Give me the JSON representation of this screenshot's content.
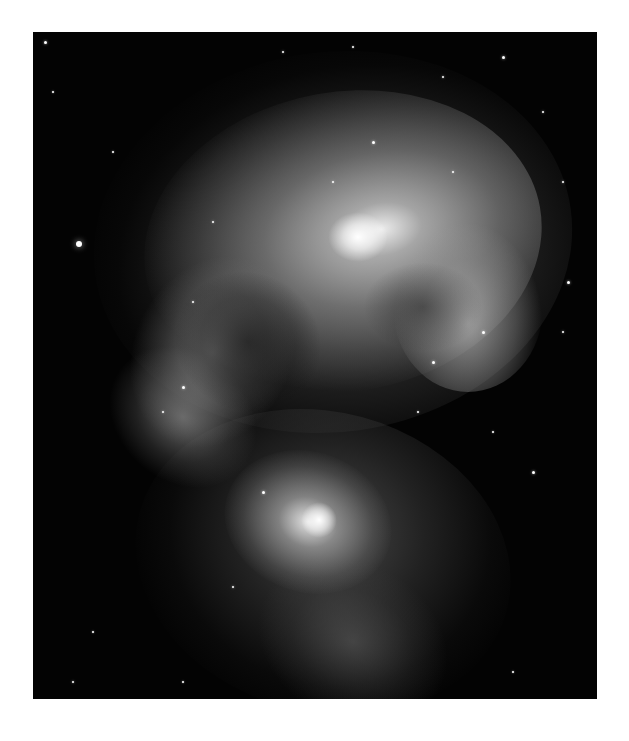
{
  "image": {
    "subject": "Interacting spiral galaxies in grayscale",
    "style": "grayscale astronomical photograph",
    "border_color": "#ffffff",
    "background_color": "#030303",
    "features": [
      "upper galaxy with bright core and dusty spiral arms",
      "lower galaxy with bright core and faint tidal extension",
      "scattered foreground stars"
    ]
  },
  "stars": [
    {
      "x": 12,
      "y": 10,
      "r": 1.5
    },
    {
      "x": 46,
      "y": 212,
      "r": 3
    },
    {
      "x": 470,
      "y": 25,
      "r": 1.5
    },
    {
      "x": 410,
      "y": 45,
      "r": 1.2
    },
    {
      "x": 510,
      "y": 80,
      "r": 1.2
    },
    {
      "x": 530,
      "y": 150,
      "r": 1.2
    },
    {
      "x": 20,
      "y": 60,
      "r": 1
    },
    {
      "x": 80,
      "y": 120,
      "r": 1
    },
    {
      "x": 530,
      "y": 300,
      "r": 1.2
    },
    {
      "x": 500,
      "y": 440,
      "r": 1.5
    },
    {
      "x": 460,
      "y": 400,
      "r": 1
    },
    {
      "x": 60,
      "y": 600,
      "r": 1
    },
    {
      "x": 40,
      "y": 650,
      "r": 1.2
    },
    {
      "x": 150,
      "y": 650,
      "r": 1
    },
    {
      "x": 535,
      "y": 250,
      "r": 1.5
    },
    {
      "x": 250,
      "y": 20,
      "r": 1.2
    },
    {
      "x": 320,
      "y": 15,
      "r": 1
    },
    {
      "x": 385,
      "y": 380,
      "r": 1
    },
    {
      "x": 200,
      "y": 555,
      "r": 1.2
    },
    {
      "x": 480,
      "y": 640,
      "r": 1
    },
    {
      "x": 340,
      "y": 110,
      "r": 1.5
    },
    {
      "x": 300,
      "y": 150,
      "r": 1.2
    },
    {
      "x": 420,
      "y": 140,
      "r": 1.2
    },
    {
      "x": 450,
      "y": 300,
      "r": 1.5
    },
    {
      "x": 400,
      "y": 330,
      "r": 1.5
    },
    {
      "x": 150,
      "y": 355,
      "r": 1.5
    },
    {
      "x": 130,
      "y": 380,
      "r": 1.2
    },
    {
      "x": 230,
      "y": 460,
      "r": 1.5
    },
    {
      "x": 160,
      "y": 270,
      "r": 1.2
    },
    {
      "x": 180,
      "y": 190,
      "r": 1.2
    }
  ]
}
